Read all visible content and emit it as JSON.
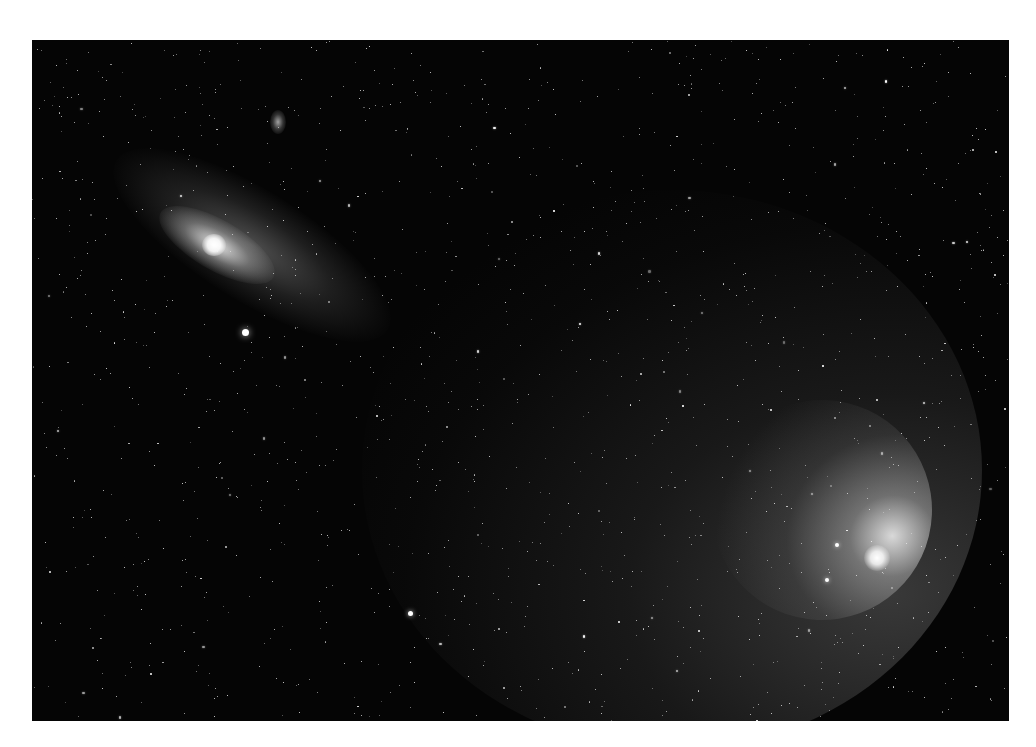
{
  "photo": {
    "subject": "Star field with galaxy and comet",
    "background_color": "#050505",
    "frame": {
      "left": 32,
      "top": 40,
      "width": 977,
      "height": 681
    }
  },
  "objects": {
    "galaxy": {
      "name": "spiral-galaxy",
      "cx": 182,
      "cy": 205,
      "color": "#ffffff"
    },
    "companion_galaxy": {
      "name": "small-elliptical-galaxy",
      "cx": 246,
      "cy": 82
    },
    "comet": {
      "name": "comet",
      "head_x": 846,
      "head_y": 518,
      "color": "#ffffff"
    },
    "bright_stars": [
      {
        "x": 213,
        "y": 292,
        "r": 3.5
      },
      {
        "x": 378,
        "y": 573,
        "r": 2.5
      },
      {
        "x": 805,
        "y": 505,
        "r": 2
      },
      {
        "x": 795,
        "y": 540,
        "r": 2
      }
    ]
  },
  "starfield": {
    "count": 1400,
    "seed": 42
  }
}
